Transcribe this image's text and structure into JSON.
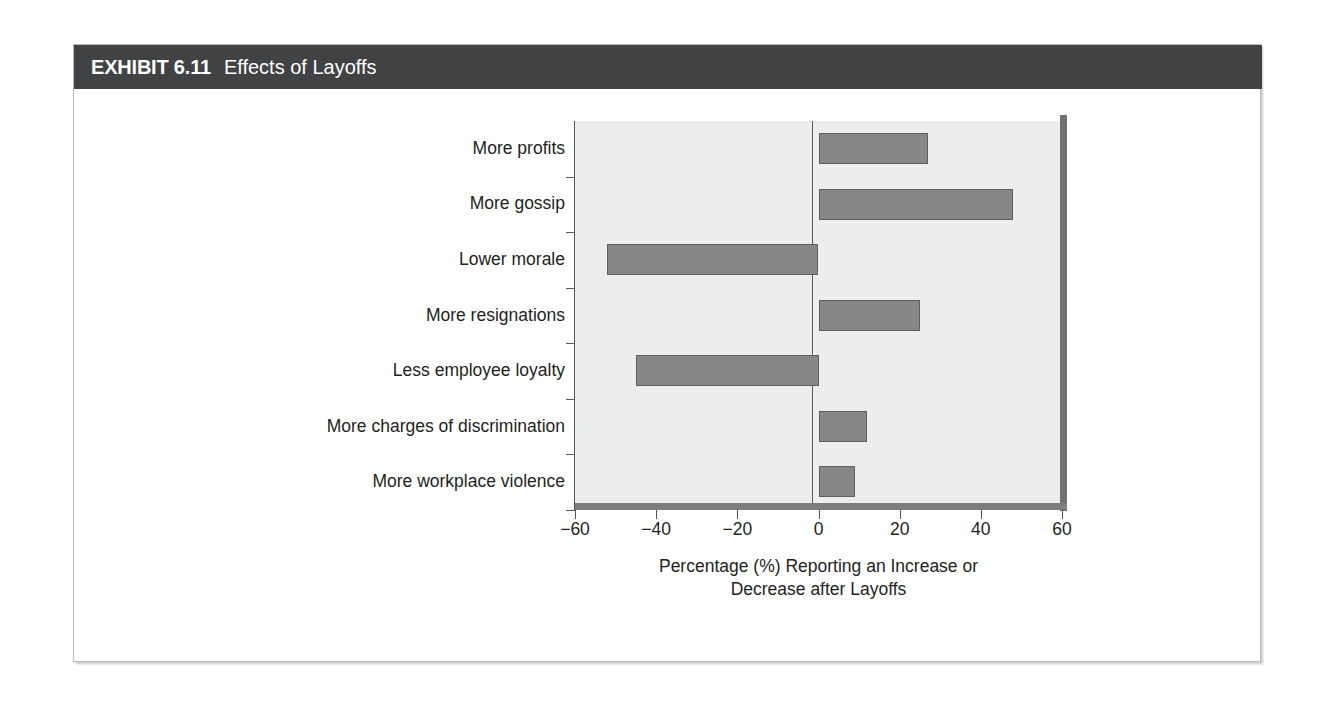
{
  "exhibit": {
    "tag": "EXHIBIT 6.11",
    "title": "Effects of Layoffs"
  },
  "colors": {
    "header_band": "#414244",
    "plot_background": "#eceded",
    "bar_fill": "#858688",
    "bar_border": "#5e5f61",
    "axis": "#58595b",
    "text": "#231f20",
    "card_border": "#b9bcbe"
  },
  "chart_data": {
    "type": "bar",
    "orientation": "horizontal",
    "title": "Effects of Layoffs",
    "categories": [
      "More profits",
      "More gossip",
      "Lower morale",
      "More resignations",
      "Less employee loyalty",
      "More charges of discrimination",
      "More workplace violence"
    ],
    "values": [
      27,
      48,
      -52,
      25,
      -45,
      12,
      9
    ],
    "xlabel": "Percentage (%) Reporting an Increase or Decrease after Layoffs",
    "xlabel_line1": "Percentage (%) Reporting an Increase or",
    "xlabel_line2": "Decrease after Layoffs",
    "ylabel": "",
    "xlim": [
      -60,
      60
    ],
    "xticks": [
      -60,
      -40,
      -20,
      0,
      20,
      40,
      60
    ],
    "xticklabels": [
      "−60",
      "−40",
      "−20",
      "0",
      "20",
      "40",
      "60"
    ],
    "grid": false,
    "legend": false
  }
}
